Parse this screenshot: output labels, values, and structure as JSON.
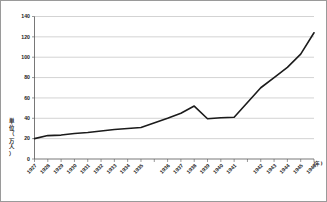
{
  "chart_data": {
    "type": "line",
    "title": "",
    "subtitle": "",
    "xlabel": "",
    "ylabel": "単位（万人）",
    "ylabel_chars": [
      "単",
      "位",
      "（",
      "万",
      "人",
      "）"
    ],
    "x_axis_suffix": "(年)",
    "categories": [
      "1927",
      "1928",
      "1929",
      "1930",
      "1931",
      "1932",
      "1933",
      "1934",
      "1935",
      "1936",
      "1937",
      "1938",
      "1939",
      "1940",
      "1941",
      "1942",
      "1943",
      "1944",
      "1945",
      "1946"
    ],
    "x": [
      1927,
      1928,
      1929,
      1930,
      1931,
      1932,
      1933,
      1934,
      1935,
      1936,
      1937,
      1938,
      1939,
      1940,
      1941,
      1942,
      1943,
      1944,
      1945,
      1946
    ],
    "values": [
      20,
      23,
      23.5,
      25,
      26,
      27.5,
      29,
      30,
      31,
      40,
      45,
      52,
      39.5,
      40.5,
      41,
      70,
      80,
      90,
      103,
      124
    ],
    "series": [
      {
        "name": "人口",
        "values": [
          20,
          23,
          23.5,
          25,
          26,
          27.5,
          29,
          30,
          31,
          40,
          45,
          52,
          39.5,
          40.5,
          41,
          70,
          80,
          90,
          103,
          124
        ]
      }
    ],
    "ylim": [
      0,
      140
    ],
    "yticks": [
      0,
      20,
      40,
      60,
      80,
      100,
      120,
      140
    ],
    "ytick_labels": [
      "0",
      "20",
      "40",
      "60",
      "80",
      "100",
      "120",
      "140"
    ],
    "xlim": [
      1927,
      1946
    ],
    "grid": true,
    "grid_axis": "y",
    "legend": false,
    "legend_position": "none",
    "line_color": "#1b1b1b",
    "grid_color": "#b5b5b5",
    "axis_color": "#555555",
    "background_color": "#ffffff",
    "border_color": "#9a9a9a",
    "annotations": []
  }
}
